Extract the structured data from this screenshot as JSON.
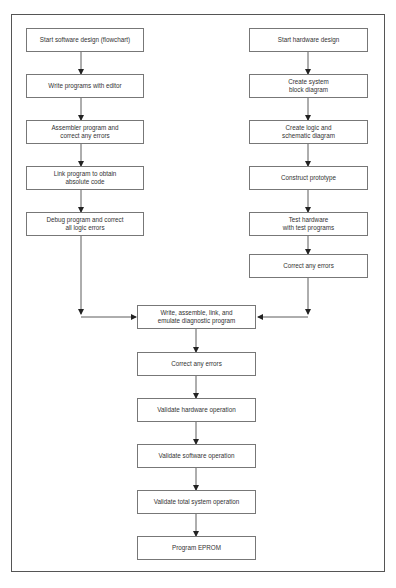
{
  "diagram": {
    "type": "flowchart",
    "software_track": [
      "Start software design (flowchart)",
      "Write programs with editor",
      "Assembler program and\ncorrect any errors",
      "Link program to obtain\nabsolute code",
      "Debug program and correct\nall logic errors"
    ],
    "hardware_track": [
      "Start hardware design",
      "Create system\nblock diagram",
      "Create logic and\nschematic diagram",
      "Construct prototype",
      "Test hardware\nwith test programs",
      "Correct any errors"
    ],
    "integration_track": [
      "Write, assemble, link, and\nemulate diagnostic program",
      "Correct any errors",
      "Validate hardware operation",
      "Validate software operation",
      "Validate total system operation",
      "Program EPROM"
    ]
  }
}
